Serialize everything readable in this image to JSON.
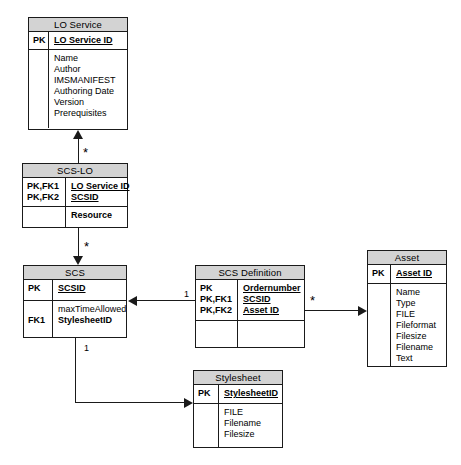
{
  "diagram": {
    "type": "entity-relationship",
    "entities": [
      {
        "id": "lo_service",
        "name": "LO Service",
        "keys": [
          "PK"
        ],
        "key_attributes": [
          "LO Service ID"
        ],
        "attributes": [
          "Name",
          "Author",
          "IMSMANIFEST",
          "Authoring Date",
          "Version",
          "Prerequisites"
        ]
      },
      {
        "id": "scs_lo",
        "name": "SCS-LO",
        "keys": [
          "PK,FK1",
          "PK,FK2"
        ],
        "key_attributes": [
          "LO Service ID",
          "SCSID"
        ],
        "attributes": [
          "Resource"
        ]
      },
      {
        "id": "scs",
        "name": "SCS",
        "keys": [
          "PK"
        ],
        "key_attributes": [
          "SCSID"
        ],
        "body_keys": [
          "",
          "FK1"
        ],
        "attributes": [
          "maxTimeAllowed",
          "StylesheetID"
        ]
      },
      {
        "id": "scs_definition",
        "name": "SCS Definition",
        "keys": [
          "PK",
          "PK,FK1",
          "PK,FK2"
        ],
        "key_attributes": [
          "Ordernumber",
          "SCSID",
          "Asset ID"
        ],
        "attributes": []
      },
      {
        "id": "asset",
        "name": "Asset",
        "keys": [
          "PK"
        ],
        "key_attributes": [
          "Asset ID"
        ],
        "attributes": [
          "Name",
          "Type",
          "FILE",
          "Fileformat",
          "Filesize",
          "Filename",
          "Text"
        ]
      },
      {
        "id": "stylesheet",
        "name": "Stylesheet",
        "keys": [
          "PK"
        ],
        "key_attributes": [
          "StylesheetID"
        ],
        "attributes": [
          "FILE",
          "Filename",
          "Filesize"
        ]
      }
    ],
    "relationships": [
      {
        "id": "scslo_to_loservice",
        "from": "scs_lo",
        "to": "lo_service",
        "cardinality": "*"
      },
      {
        "id": "scslo_to_scs",
        "from": "scs_lo",
        "to": "scs",
        "cardinality": "*"
      },
      {
        "id": "scsdef_to_scs",
        "from": "scs_definition",
        "to": "scs",
        "cardinality": "1"
      },
      {
        "id": "scsdef_to_asset",
        "from": "scs_definition",
        "to": "asset",
        "cardinality": "*"
      },
      {
        "id": "scs_to_stylesheet",
        "from": "scs",
        "to": "stylesheet",
        "cardinality": "1"
      }
    ]
  },
  "colors": {
    "header_fill": "#d3d3d3",
    "border": "#1a1a1a",
    "background": "#ffffff"
  }
}
